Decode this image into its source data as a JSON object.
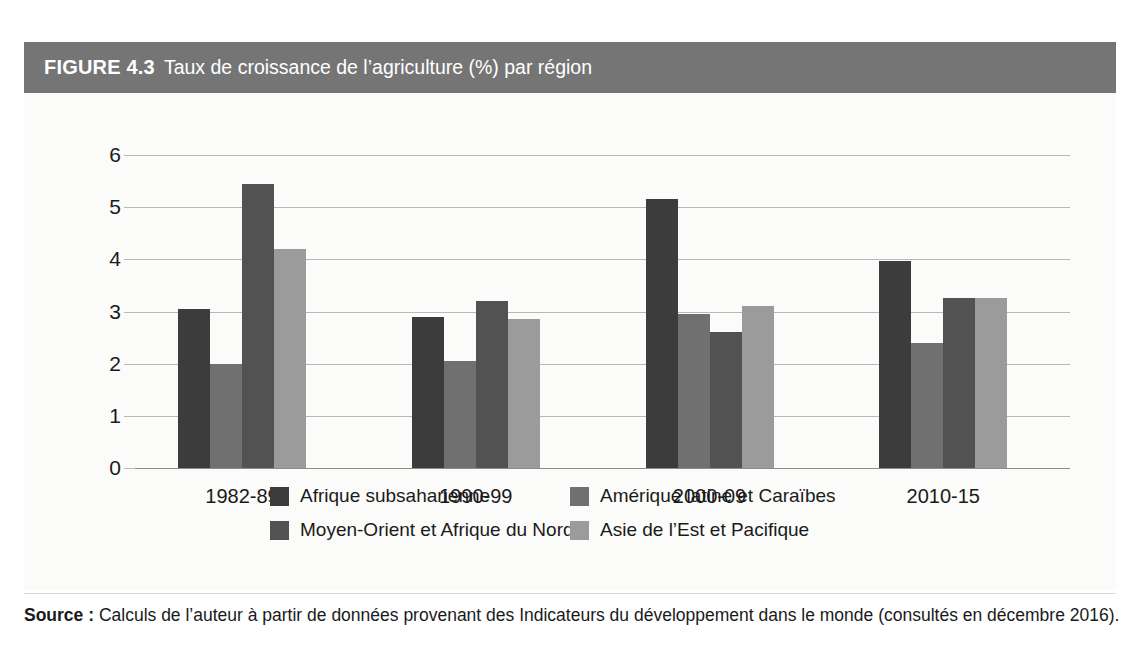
{
  "figure": {
    "number": "FIGURE 4.3",
    "title": "Taux de croissance de l’agriculture (%) par région",
    "banner_color": "#757575"
  },
  "source": {
    "label": "Source :",
    "text": " Calculs de l’auteur à partir de données provenant des Indicateurs du développement dans le monde (consultés en décembre 2016)."
  },
  "chart_data": {
    "type": "bar",
    "title": "Taux de croissance de l’agriculture (%) par région",
    "xlabel": "",
    "ylabel": "",
    "ylim": [
      0,
      6
    ],
    "yticks": [
      0,
      1,
      2,
      3,
      4,
      5,
      6
    ],
    "ytick_labels": [
      "0",
      "1",
      "2",
      "3",
      "4",
      "5",
      "6"
    ],
    "grid": true,
    "legend_position": "bottom",
    "categories": [
      "1982-89",
      "1990-99",
      "2000-09",
      "2010-15"
    ],
    "series": [
      {
        "name": "Afrique subsaharienne",
        "color": "#3c3c3c",
        "values": [
          3.05,
          2.9,
          5.15,
          3.97
        ]
      },
      {
        "name": "Amérique latine et Caraïbes",
        "color": "#707070",
        "values": [
          2.0,
          2.05,
          2.95,
          2.4
        ]
      },
      {
        "name": "Moyen-Orient et Afrique du Nord",
        "color": "#525252",
        "values": [
          5.45,
          3.2,
          2.6,
          3.25
        ]
      },
      {
        "name": "Asie de l’Est et Pacifique",
        "color": "#9b9b9b",
        "values": [
          4.2,
          2.85,
          3.1,
          3.25
        ]
      }
    ]
  },
  "legend": {
    "items": [
      {
        "label": "Afrique subsaharienne",
        "color": "#3c3c3c"
      },
      {
        "label": "Amérique latine et Caraïbes",
        "color": "#707070"
      },
      {
        "label": "Moyen-Orient et Afrique du Nord",
        "color": "#525252"
      },
      {
        "label": "Asie de l’Est et Pacifique",
        "color": "#9b9b9b"
      }
    ]
  }
}
